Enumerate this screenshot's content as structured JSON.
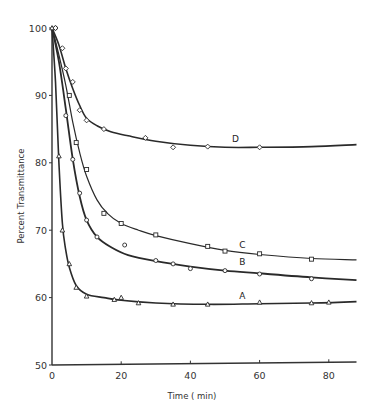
{
  "chart_data": {
    "type": "line",
    "title": "",
    "xlabel": "Time ( min)",
    "ylabel": "Percent Transmittance",
    "xlim": [
      0,
      88
    ],
    "ylim": [
      50,
      100
    ],
    "x_ticks": [
      0,
      20,
      40,
      60,
      80
    ],
    "y_ticks": [
      50,
      60,
      70,
      80,
      90,
      100
    ],
    "grid": false,
    "legend": "inline curve labels",
    "series": [
      {
        "name": "A",
        "marker": "triangle",
        "points": [
          [
            0,
            100
          ],
          [
            2,
            81
          ],
          [
            3,
            70
          ],
          [
            5,
            65
          ],
          [
            7,
            61.5
          ],
          [
            10,
            60.2
          ],
          [
            18,
            59.7
          ],
          [
            20,
            60
          ],
          [
            25,
            59.2
          ],
          [
            35,
            59
          ],
          [
            45,
            59
          ],
          [
            60,
            59.3
          ],
          [
            75,
            59.2
          ],
          [
            80,
            59.3
          ]
        ],
        "curve": [
          [
            0,
            100
          ],
          [
            1,
            92
          ],
          [
            2,
            80
          ],
          [
            3,
            71
          ],
          [
            4,
            67
          ],
          [
            5,
            64.5
          ],
          [
            7,
            61.8
          ],
          [
            10,
            60.5
          ],
          [
            15,
            60
          ],
          [
            20,
            59.6
          ],
          [
            30,
            59.2
          ],
          [
            45,
            59
          ],
          [
            60,
            59.1
          ],
          [
            75,
            59.2
          ],
          [
            88,
            59.4
          ]
        ],
        "label_at": [
          55,
          59.8
        ]
      },
      {
        "name": "B",
        "marker": "circle",
        "points": [
          [
            1,
            100
          ],
          [
            4,
            87
          ],
          [
            6,
            80.5
          ],
          [
            8,
            75.5
          ],
          [
            10,
            71.5
          ],
          [
            13,
            69
          ],
          [
            21,
            67.8
          ],
          [
            30,
            65.5
          ],
          [
            35,
            65
          ],
          [
            40,
            64.3
          ],
          [
            50,
            64
          ],
          [
            60,
            63.5
          ],
          [
            75,
            62.8
          ]
        ],
        "curve": [
          [
            0,
            100
          ],
          [
            2,
            95
          ],
          [
            4,
            88
          ],
          [
            6,
            80.5
          ],
          [
            8,
            75
          ],
          [
            10,
            71.5
          ],
          [
            13,
            69
          ],
          [
            17,
            67.5
          ],
          [
            22,
            66.3
          ],
          [
            30,
            65.4
          ],
          [
            40,
            64.6
          ],
          [
            50,
            64
          ],
          [
            60,
            63.6
          ],
          [
            75,
            63
          ],
          [
            88,
            62.6
          ]
        ],
        "label_at": [
          55,
          64.8
        ]
      },
      {
        "name": "C",
        "marker": "square",
        "points": [
          [
            5,
            90
          ],
          [
            7,
            83
          ],
          [
            10,
            79
          ],
          [
            15,
            72.5
          ],
          [
            20,
            71
          ],
          [
            30,
            69.3
          ],
          [
            45,
            67.6
          ],
          [
            50,
            66.9
          ],
          [
            60,
            66.5
          ],
          [
            75,
            65.7
          ]
        ],
        "curve": [
          [
            0,
            100
          ],
          [
            2,
            96
          ],
          [
            4,
            91.5
          ],
          [
            6,
            86
          ],
          [
            8,
            81.5
          ],
          [
            10,
            78
          ],
          [
            13,
            74.5
          ],
          [
            16,
            72.5
          ],
          [
            20,
            71
          ],
          [
            25,
            70
          ],
          [
            30,
            69.2
          ],
          [
            40,
            68
          ],
          [
            50,
            67
          ],
          [
            60,
            66.4
          ],
          [
            75,
            65.8
          ],
          [
            88,
            65.6
          ]
        ],
        "label_at": [
          55,
          67.4
        ]
      },
      {
        "name": "D",
        "marker": "diamond",
        "points": [
          [
            1,
            100
          ],
          [
            3,
            97
          ],
          [
            4,
            94
          ],
          [
            6,
            92
          ],
          [
            8,
            87.8
          ],
          [
            10,
            86.3
          ],
          [
            15,
            85
          ],
          [
            27,
            83.7
          ],
          [
            35,
            82.3
          ],
          [
            45,
            82.4
          ],
          [
            60,
            82.3
          ]
        ],
        "curve": [
          [
            0,
            100
          ],
          [
            2,
            97.5
          ],
          [
            4,
            94
          ],
          [
            6,
            91
          ],
          [
            8,
            88.5
          ],
          [
            10,
            86.6
          ],
          [
            13,
            85.5
          ],
          [
            17,
            84.6
          ],
          [
            22,
            84
          ],
          [
            30,
            83.2
          ],
          [
            40,
            82.6
          ],
          [
            50,
            82.3
          ],
          [
            60,
            82.3
          ],
          [
            75,
            82.4
          ],
          [
            88,
            82.7
          ]
        ],
        "label_at": [
          53,
          83.1
        ]
      }
    ]
  },
  "axes": {
    "xlabel": "Time ( min)",
    "ylabel": "Percent Transmittance",
    "x_tick_labels": [
      "0",
      "20",
      "40",
      "60",
      "80"
    ],
    "y_tick_labels": [
      "50",
      "60",
      "70",
      "80",
      "90",
      "100"
    ]
  },
  "colors": {
    "line": "#2a2a2a",
    "axis": "#333333",
    "background": "#ffffff"
  }
}
